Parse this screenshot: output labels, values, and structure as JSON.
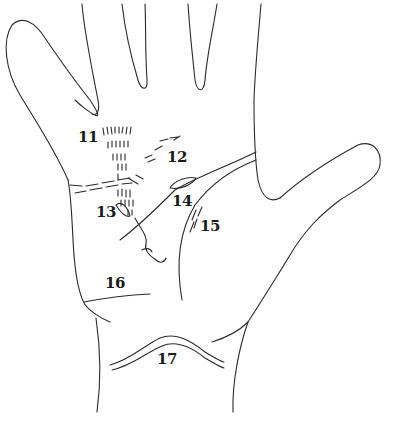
{
  "diagram": {
    "stroke_color": "#2a2a2a",
    "background": "#ffffff",
    "labels": [
      {
        "id": "11",
        "text": "11",
        "x": 78,
        "y": 130
      },
      {
        "id": "12",
        "text": "12",
        "x": 167,
        "y": 150
      },
      {
        "id": "13",
        "text": "13",
        "x": 96,
        "y": 205
      },
      {
        "id": "14",
        "text": "14",
        "x": 172,
        "y": 194
      },
      {
        "id": "15",
        "text": "15",
        "x": 200,
        "y": 219
      },
      {
        "id": "16",
        "text": "16",
        "x": 105,
        "y": 276
      },
      {
        "id": "17",
        "text": "17",
        "x": 157,
        "y": 352
      }
    ]
  }
}
